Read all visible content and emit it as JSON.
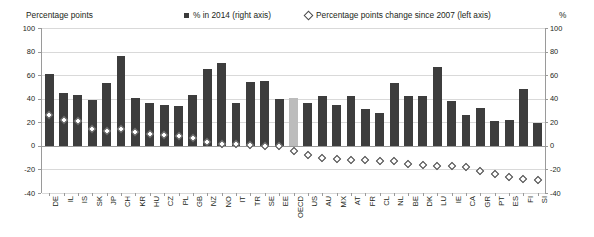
{
  "header": {
    "left_axis_title": "Percentage points",
    "right_axis_title": "%"
  },
  "legend": {
    "bars": {
      "label": "% in 2014 (right axis)",
      "marker": "filled-square-marker",
      "color": "#3d3d3d"
    },
    "diamonds": {
      "label": "Percentage points change since 2007 (left axis)",
      "marker": "open-diamond-marker",
      "color": "#3f3f3f"
    }
  },
  "axes": {
    "left_ticks": [
      "100",
      "80",
      "60",
      "40",
      "20",
      "0",
      "-20",
      "-40"
    ],
    "right_ticks": [
      "100",
      "80",
      "60",
      "40",
      "20",
      "0",
      "-20",
      "-40"
    ],
    "ymin": -40,
    "ymax": 100,
    "grid": true
  },
  "chart_data": {
    "type": "bar",
    "title": "",
    "subtitle": "",
    "xlabel": "",
    "ylabel": "Percentage points",
    "y2label": "%",
    "ylim": [
      -40,
      100
    ],
    "y2lim": [
      -40,
      100
    ],
    "grid": true,
    "legend_position": "top",
    "highlight_category": "OECD",
    "highlight_color": "#bcbcbc",
    "categories": [
      "DE",
      "IL",
      "IS",
      "SK",
      "JP",
      "CH",
      "KR",
      "HU",
      "CZ",
      "PL",
      "GB",
      "NZ",
      "NO",
      "IT",
      "TR",
      "SE",
      "EE",
      "OECD",
      "US",
      "AU",
      "MX",
      "AT",
      "FR",
      "CL",
      "NL",
      "BE",
      "DK",
      "LU",
      "IE",
      "CA",
      "GR",
      "PT",
      "ES",
      "FI",
      "SI"
    ],
    "series": [
      {
        "name": "% in 2014 (right axis)",
        "type": "bar",
        "axis": "right",
        "color": "#3d3d3d",
        "values": [
          61,
          45,
          43,
          39,
          53,
          76,
          41,
          36,
          35,
          34,
          43,
          65,
          70,
          36,
          54,
          55,
          40,
          41,
          36,
          42,
          35,
          42,
          31,
          28,
          53,
          42,
          42,
          67,
          38,
          26,
          32,
          21,
          22,
          48,
          19
        ]
      },
      {
        "name": "Percentage points change since 2007 (left axis)",
        "type": "scatter",
        "axis": "left",
        "marker": "open-diamond",
        "color": "#3f3f3f",
        "values": [
          26,
          22,
          21,
          14,
          13,
          14,
          12,
          10,
          9,
          8,
          7,
          3,
          2,
          2,
          1,
          0,
          0,
          -4,
          -8,
          -10,
          -11,
          -12,
          -12,
          -13,
          -13,
          -15,
          -16,
          -17,
          -17,
          -18,
          -21,
          -24,
          -26,
          -28,
          -29
        ]
      }
    ]
  }
}
